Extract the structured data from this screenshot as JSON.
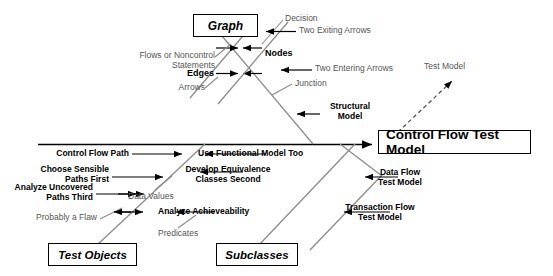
{
  "diagram": {
    "type": "fishbone-ishikawa",
    "head": {
      "label": "Control Flow Test Model"
    },
    "dashed_annotation": {
      "label": "Test Model"
    },
    "categories": [
      {
        "name": "graph-box",
        "label": "Graph"
      },
      {
        "name": "test-objects-box",
        "label": "Test Objects"
      },
      {
        "name": "subclasses-box",
        "label": "Subclasses"
      }
    ],
    "graph_branch": {
      "edges_label": "Edges",
      "nodes_label": "Nodes",
      "edges_causes": [
        "Flows or Noncontrol\nStatements",
        "Arrows"
      ],
      "nodes_causes": [
        "Decision",
        "Two Exiting Arrows",
        "Two Entering Arrows",
        "Junction"
      ],
      "structural_model": "Structural\nModel"
    },
    "test_objects_branch": {
      "causes": [
        "Control Flow Path",
        "Choose Sensible\nPaths First",
        "Analyze Uncovered\nPaths Third"
      ],
      "light_causes": [
        "Probably a Flaw"
      ]
    },
    "subclasses_branch": {
      "causes": [
        "Use Functional Model Too",
        "Develop Equivalence\nClasses Second",
        "Analyze Achieveability"
      ],
      "light_causes": [
        "Data Values",
        "Predicates"
      ]
    },
    "lower_right_branch": {
      "causes": [
        "Data Flow\nTest Model",
        "Transaction Flow\nTest Model"
      ]
    },
    "colors": {
      "spine": "#000000",
      "rib": "#808080",
      "text": "#000000",
      "light_text": "#555555",
      "box_border": "#000000",
      "background": "#ffffff"
    }
  }
}
